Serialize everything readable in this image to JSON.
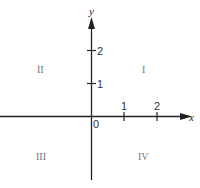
{
  "diagram": {
    "type": "cartesian-coordinate-plane",
    "axes": {
      "x_label": "x",
      "y_label": "y",
      "origin_label": "0"
    },
    "x_ticks": [
      {
        "label": "1"
      },
      {
        "label": "2"
      }
    ],
    "y_ticks": [
      {
        "label": "1"
      },
      {
        "label": "2"
      }
    ],
    "quadrants": {
      "I": "I",
      "II": "II",
      "III": "III",
      "IV": "IV"
    },
    "colors": {
      "axis": "#222222",
      "text": "#333333",
      "quadrant_text": "#777777",
      "background": "#ffffff"
    }
  }
}
